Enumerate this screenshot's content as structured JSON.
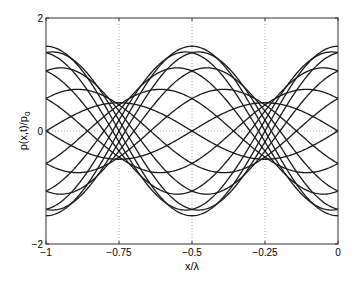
{
  "chart_data": {
    "type": "line",
    "title": "",
    "xlabel": "x/λ",
    "ylabel": "p(x,t)/p",
    "ylabel_subscript": "0",
    "xlim": [
      -1,
      0
    ],
    "ylim": [
      -2,
      2
    ],
    "xticks": [
      -1,
      -0.75,
      -0.5,
      -0.25,
      0
    ],
    "xtick_labels": [
      "−1",
      "−0.75",
      "−0.5",
      "−0.25",
      "0"
    ],
    "yticks": [
      -2,
      0,
      2
    ],
    "ytick_labels": [
      "−2",
      "0",
      "2"
    ],
    "grid": {
      "vertical_at": [
        -0.75,
        -0.5,
        -0.25
      ],
      "horizontal_at": [
        0
      ],
      "style": "dotted"
    },
    "legend": null,
    "model": {
      "description": "Partial standing wave: incident + reflected wave snapshots at successive times",
      "formula": "p(x,t)/p0 = cos(ωt − 2πx/λ) + R·cos(ωt + 2πx/λ)",
      "incident_amplitude": 1.0,
      "reflection_coefficient": 0.5,
      "num_time_snapshots": 16,
      "phase_step_rad": 0.3927
    },
    "envelope": {
      "max": 1.5,
      "min": 0.5,
      "antinodes_x": [
        -1,
        -0.5,
        0
      ],
      "nodes_x": [
        -0.75,
        -0.25
      ]
    },
    "series_sample_x": [
      -1,
      -0.875,
      -0.75,
      -0.625,
      -0.5,
      -0.375,
      -0.25,
      -0.125,
      0
    ],
    "series": [
      {
        "name": "ωt=0",
        "values": [
          1.5,
          0.71,
          0,
          -0.71,
          -1.5,
          -0.71,
          0,
          0.71,
          1.5
        ]
      },
      {
        "name": "ωt=π/8",
        "values": [
          1.39,
          1.0,
          0.19,
          -0.38,
          -1.39,
          -0.93,
          -0.19,
          0.38,
          1.39
        ]
      },
      {
        "name": "ωt=π/4",
        "values": [
          1.06,
          1.15,
          0.35,
          -0.06,
          -1.06,
          -1.06,
          -0.35,
          0.06,
          1.06
        ]
      },
      {
        "name": "ωt=3π/8",
        "values": [
          0.57,
          1.13,
          0.46,
          0.26,
          -0.57,
          -1.06,
          -0.46,
          -0.26,
          0.57
        ]
      },
      {
        "name": "ωt=π/2",
        "values": [
          0,
          0.71,
          0.5,
          0.71,
          0,
          -0.71,
          -0.5,
          -0.71,
          0
        ]
      },
      {
        "name": "ωt=5π/8",
        "values": [
          -0.57,
          0.26,
          0.46,
          1.13,
          0.57,
          -0.26,
          -0.46,
          -1.13,
          -0.57
        ]
      },
      {
        "name": "ωt=3π/4",
        "values": [
          -1.06,
          -0.06,
          0.35,
          1.15,
          1.06,
          0.06,
          -0.35,
          -1.15,
          -1.06
        ]
      },
      {
        "name": "ωt=7π/8",
        "values": [
          -1.39,
          -0.38,
          0.19,
          1.0,
          1.39,
          0.38,
          -0.19,
          -1.0,
          -1.39
        ]
      },
      {
        "name": "ωt=π",
        "values": [
          -1.5,
          -0.71,
          0,
          0.71,
          1.5,
          0.71,
          0,
          -0.71,
          -1.5
        ]
      }
    ]
  },
  "axes": {
    "xlabel": "x/λ",
    "ylabel_main": "p(x,t)/p",
    "ylabel_sub": "0"
  }
}
